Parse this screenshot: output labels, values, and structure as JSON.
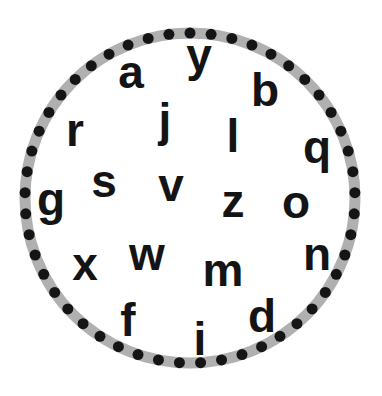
{
  "worksheet": {
    "ring": {
      "center": [
        190,
        198
      ],
      "radius": 165,
      "band_width": 11,
      "band_color": "#b0b0b0",
      "dot_color": "#151515",
      "dot_count": 49,
      "dot_radius": 5.5
    },
    "letters": [
      {
        "char": "a",
        "x": 131,
        "y": 88
      },
      {
        "char": "y",
        "x": 199,
        "y": 71
      },
      {
        "char": "b",
        "x": 265,
        "y": 106
      },
      {
        "char": "j",
        "x": 165,
        "y": 136
      },
      {
        "char": "l",
        "x": 233,
        "y": 152
      },
      {
        "char": "r",
        "x": 75,
        "y": 146
      },
      {
        "char": "q",
        "x": 317,
        "y": 163
      },
      {
        "char": "s",
        "x": 104,
        "y": 197
      },
      {
        "char": "v",
        "x": 171,
        "y": 201
      },
      {
        "char": "g",
        "x": 51,
        "y": 215
      },
      {
        "char": "z",
        "x": 233,
        "y": 217
      },
      {
        "char": "o",
        "x": 296,
        "y": 218
      },
      {
        "char": "x",
        "x": 85,
        "y": 280
      },
      {
        "char": "w",
        "x": 147,
        "y": 270
      },
      {
        "char": "n",
        "x": 317,
        "y": 270
      },
      {
        "char": "m",
        "x": 223,
        "y": 286
      },
      {
        "char": "f",
        "x": 128,
        "y": 336
      },
      {
        "char": "d",
        "x": 262,
        "y": 332
      },
      {
        "char": "i",
        "x": 200,
        "y": 355
      }
    ]
  }
}
